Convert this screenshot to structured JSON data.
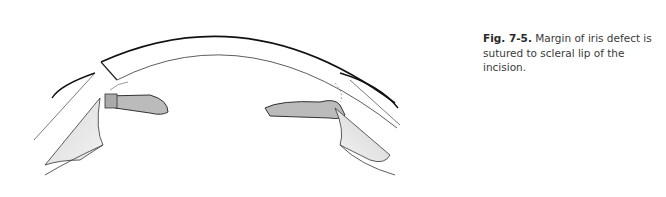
{
  "figure": {
    "label": "Fig. 7-5.",
    "caption": "Margin of iris defect is sutured to scleral lip of the incision."
  }
}
